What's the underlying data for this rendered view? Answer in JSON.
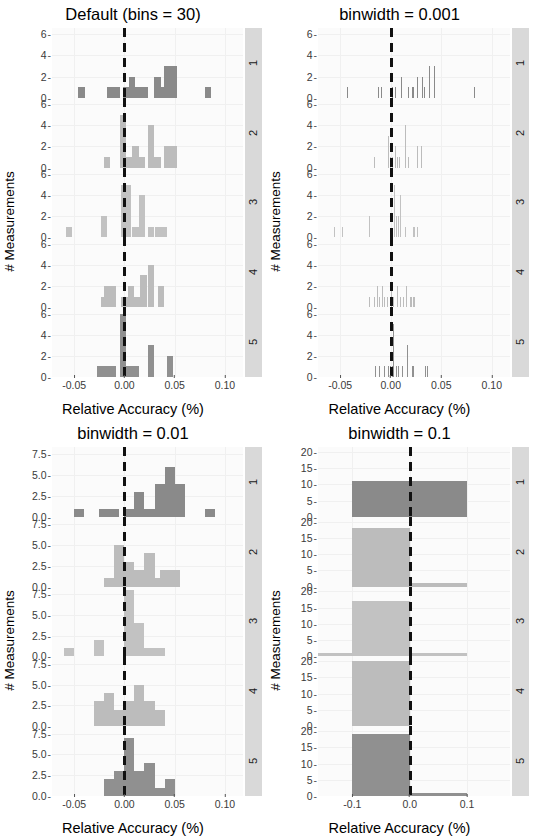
{
  "figure": {
    "xlabel": "Relative Accuracy (%)",
    "ylabel": "# Measurements",
    "strip_labels": [
      "1",
      "2",
      "3",
      "4",
      "5"
    ],
    "facet_colors": [
      "#8a8a8a",
      "#bcbcbc",
      "#c2c2c2",
      "#bcbcbc",
      "#909090"
    ],
    "refline_color": "#111111",
    "refline_value": 0
  },
  "chart_data": [
    {
      "id": "default-bins-30",
      "type": "bar",
      "title": "Default (bins = 30)",
      "xlabel": "Relative Accuracy (%)",
      "ylabel": "# Measurements",
      "xlim": [
        -0.072,
        0.118
      ],
      "ylim": [
        0,
        6.6
      ],
      "xticks": [
        -0.05,
        0.0,
        0.05,
        0.1
      ],
      "xticklabels": [
        "-0.05",
        "0.00",
        "0.05",
        "0.10"
      ],
      "yticks": [
        0,
        2,
        4,
        6
      ],
      "yticklabels": [
        "0",
        "2",
        "4",
        "6"
      ],
      "binwidth": 0.0063,
      "grid": true,
      "legend": "none",
      "facets": [
        {
          "label": "1",
          "bins": [
            {
              "x": -0.0425,
              "w": 0.0063,
              "y": 1
            },
            {
              "x": -0.011,
              "w": 0.0126,
              "y": 1
            },
            {
              "x": 0.0016,
              "w": 0.0063,
              "y": 1
            },
            {
              "x": 0.0079,
              "w": 0.0063,
              "y": 2
            },
            {
              "x": 0.0142,
              "w": 0.0063,
              "y": 1
            },
            {
              "x": 0.0205,
              "w": 0.0063,
              "y": 1
            },
            {
              "x": 0.0331,
              "w": 0.0063,
              "y": 2
            },
            {
              "x": 0.0394,
              "w": 0.0063,
              "y": 1
            },
            {
              "x": 0.0457,
              "w": 0.0126,
              "y": 3
            },
            {
              "x": 0.0835,
              "w": 0.0063,
              "y": 1
            }
          ]
        },
        {
          "label": "2",
          "bins": [
            {
              "x": -0.0173,
              "w": 0.0063,
              "y": 1
            },
            {
              "x": -0.0016,
              "w": 0.0063,
              "y": 5
            },
            {
              "x": 0.0047,
              "w": 0.0063,
              "y": 1
            },
            {
              "x": 0.011,
              "w": 0.0063,
              "y": 2
            },
            {
              "x": 0.0173,
              "w": 0.0063,
              "y": 1
            },
            {
              "x": 0.0268,
              "w": 0.0063,
              "y": 4
            },
            {
              "x": 0.0331,
              "w": 0.0063,
              "y": 1
            },
            {
              "x": 0.0457,
              "w": 0.0126,
              "y": 2
            }
          ]
        },
        {
          "label": "3",
          "bins": [
            {
              "x": -0.0551,
              "w": 0.0063,
              "y": 1
            },
            {
              "x": -0.0205,
              "w": 0.0063,
              "y": 2
            },
            {
              "x": 0.0016,
              "w": 0.0095,
              "y": 5
            },
            {
              "x": 0.0111,
              "w": 0.0063,
              "y": 1
            },
            {
              "x": 0.0174,
              "w": 0.0063,
              "y": 4
            },
            {
              "x": 0.0268,
              "w": 0.0063,
              "y": 1
            },
            {
              "x": 0.0363,
              "w": 0.0126,
              "y": 1
            }
          ]
        },
        {
          "label": "4",
          "bins": [
            {
              "x": -0.0205,
              "w": 0.0063,
              "y": 1
            },
            {
              "x": -0.0142,
              "w": 0.0126,
              "y": 2
            },
            {
              "x": 0.0,
              "w": 0.0063,
              "y": 1
            },
            {
              "x": 0.0063,
              "w": 0.0063,
              "y": 2
            },
            {
              "x": 0.0126,
              "w": 0.0063,
              "y": 1
            },
            {
              "x": 0.0189,
              "w": 0.0063,
              "y": 3
            },
            {
              "x": 0.0268,
              "w": 0.0063,
              "y": 4
            },
            {
              "x": 0.0363,
              "w": 0.0063,
              "y": 2
            }
          ]
        },
        {
          "label": "5",
          "bins": [
            {
              "x": -0.0173,
              "w": 0.0189,
              "y": 1
            },
            {
              "x": -0.0016,
              "w": 0.0063,
              "y": 6
            },
            {
              "x": 0.0047,
              "w": 0.0189,
              "y": 1
            },
            {
              "x": 0.0268,
              "w": 0.0063,
              "y": 3
            },
            {
              "x": 0.0457,
              "w": 0.0063,
              "y": 2
            }
          ]
        }
      ]
    },
    {
      "id": "binwidth-0.001",
      "type": "bar",
      "title": "binwidth = 0.001",
      "xlabel": "Relative Accuracy (%)",
      "ylabel": "# Measurements",
      "xlim": [
        -0.072,
        0.118
      ],
      "ylim": [
        0,
        6.6
      ],
      "xticks": [
        -0.05,
        0.0,
        0.05,
        0.1
      ],
      "xticklabels": [
        "-0.05",
        "0.00",
        "0.05",
        "0.10"
      ],
      "yticks": [
        0,
        2,
        4,
        6
      ],
      "yticklabels": [
        "0",
        "2",
        "4",
        "6"
      ],
      "binwidth": 0.001,
      "grid": true,
      "legend": "none",
      "facets": [
        {
          "label": "1",
          "bins": [
            {
              "x": -0.043,
              "w": 0.001,
              "y": 1
            },
            {
              "x": -0.012,
              "w": 0.001,
              "y": 1
            },
            {
              "x": -0.009,
              "w": 0.001,
              "y": 1
            },
            {
              "x": 0.002,
              "w": 0.001,
              "y": 1
            },
            {
              "x": 0.005,
              "w": 0.001,
              "y": 1
            },
            {
              "x": 0.011,
              "w": 0.001,
              "y": 2
            },
            {
              "x": 0.018,
              "w": 0.001,
              "y": 1
            },
            {
              "x": 0.022,
              "w": 0.001,
              "y": 1
            },
            {
              "x": 0.026,
              "w": 0.001,
              "y": 2
            },
            {
              "x": 0.031,
              "w": 0.001,
              "y": 2
            },
            {
              "x": 0.033,
              "w": 0.001,
              "y": 1
            },
            {
              "x": 0.038,
              "w": 0.001,
              "y": 3
            },
            {
              "x": 0.043,
              "w": 0.001,
              "y": 3
            },
            {
              "x": 0.083,
              "w": 0.001,
              "y": 1
            }
          ]
        },
        {
          "label": "2",
          "bins": [
            {
              "x": -0.016,
              "w": 0.001,
              "y": 1
            },
            {
              "x": -0.002,
              "w": 0.001,
              "y": 3
            },
            {
              "x": 0.0,
              "w": 0.001,
              "y": 1
            },
            {
              "x": 0.002,
              "w": 0.001,
              "y": 1
            },
            {
              "x": 0.0045,
              "w": 0.001,
              "y": 2
            },
            {
              "x": 0.007,
              "w": 0.001,
              "y": 1
            },
            {
              "x": 0.0085,
              "w": 0.001,
              "y": 1
            },
            {
              "x": 0.015,
              "w": 0.001,
              "y": 4
            },
            {
              "x": 0.018,
              "w": 0.001,
              "y": 1
            },
            {
              "x": 0.026,
              "w": 0.001,
              "y": 2
            },
            {
              "x": 0.03,
              "w": 0.001,
              "y": 2
            }
          ]
        },
        {
          "label": "3",
          "bins": [
            {
              "x": -0.056,
              "w": 0.001,
              "y": 1
            },
            {
              "x": -0.048,
              "w": 0.001,
              "y": 1
            },
            {
              "x": -0.021,
              "w": 0.001,
              "y": 2
            },
            {
              "x": 0.004,
              "w": 0.001,
              "y": 5
            },
            {
              "x": 0.006,
              "w": 0.001,
              "y": 2
            },
            {
              "x": 0.0075,
              "w": 0.001,
              "y": 2
            },
            {
              "x": 0.01,
              "w": 0.001,
              "y": 4
            },
            {
              "x": 0.015,
              "w": 0.001,
              "y": 1
            },
            {
              "x": 0.023,
              "w": 0.001,
              "y": 1
            },
            {
              "x": 0.026,
              "w": 0.001,
              "y": 1
            }
          ]
        },
        {
          "label": "4",
          "bins": [
            {
              "x": -0.021,
              "w": 0.001,
              "y": 1
            },
            {
              "x": -0.016,
              "w": 0.001,
              "y": 1
            },
            {
              "x": -0.013,
              "w": 0.001,
              "y": 2
            },
            {
              "x": -0.011,
              "w": 0.001,
              "y": 1
            },
            {
              "x": -0.008,
              "w": 0.001,
              "y": 2
            },
            {
              "x": -0.006,
              "w": 0.001,
              "y": 1
            },
            {
              "x": -0.003,
              "w": 0.001,
              "y": 1
            },
            {
              "x": 0.001,
              "w": 0.001,
              "y": 2
            },
            {
              "x": 0.003,
              "w": 0.001,
              "y": 1
            },
            {
              "x": 0.007,
              "w": 0.001,
              "y": 2
            },
            {
              "x": 0.01,
              "w": 0.001,
              "y": 1
            },
            {
              "x": 0.013,
              "w": 0.001,
              "y": 1
            },
            {
              "x": 0.016,
              "w": 0.001,
              "y": 2
            },
            {
              "x": 0.02,
              "w": 0.001,
              "y": 1
            },
            {
              "x": 0.023,
              "w": 0.001,
              "y": 1
            }
          ]
        },
        {
          "label": "5",
          "bins": [
            {
              "x": -0.015,
              "w": 0.001,
              "y": 1
            },
            {
              "x": -0.011,
              "w": 0.001,
              "y": 1
            },
            {
              "x": -0.006,
              "w": 0.001,
              "y": 1
            },
            {
              "x": -0.002,
              "w": 0.001,
              "y": 1
            },
            {
              "x": 0.0,
              "w": 0.001,
              "y": 1
            },
            {
              "x": 0.0015,
              "w": 0.001,
              "y": 1
            },
            {
              "x": 0.003,
              "w": 0.001,
              "y": 5
            },
            {
              "x": 0.0055,
              "w": 0.001,
              "y": 1
            },
            {
              "x": 0.008,
              "w": 0.001,
              "y": 1
            },
            {
              "x": 0.012,
              "w": 0.001,
              "y": 1
            },
            {
              "x": 0.017,
              "w": 0.001,
              "y": 3
            },
            {
              "x": 0.022,
              "w": 0.001,
              "y": 1
            },
            {
              "x": 0.034,
              "w": 0.001,
              "y": 1
            },
            {
              "x": 0.036,
              "w": 0.001,
              "y": 1
            }
          ]
        }
      ]
    },
    {
      "id": "binwidth-0.01",
      "type": "bar",
      "title": "binwidth = 0.01",
      "xlabel": "Relative Accuracy (%)",
      "ylabel": "# Measurements",
      "xlim": [
        -0.072,
        0.118
      ],
      "ylim": [
        0,
        8.4
      ],
      "xticks": [
        -0.05,
        0.0,
        0.05,
        0.1
      ],
      "xticklabels": [
        "-0.05",
        "0.00",
        "0.05",
        "0.10"
      ],
      "yticks": [
        0.0,
        2.5,
        5.0,
        7.5
      ],
      "yticklabels": [
        "0.0",
        "2.5",
        "5.0",
        "7.5"
      ],
      "binwidth": 0.01,
      "grid": true,
      "legend": "none",
      "facets": [
        {
          "label": "1",
          "bins": [
            {
              "x": -0.045,
              "w": 0.01,
              "y": 1
            },
            {
              "x": -0.015,
              "w": 0.02,
              "y": 1
            },
            {
              "x": 0.005,
              "w": 0.01,
              "y": 1
            },
            {
              "x": 0.015,
              "w": 0.01,
              "y": 3
            },
            {
              "x": 0.025,
              "w": 0.01,
              "y": 1
            },
            {
              "x": 0.035,
              "w": 0.01,
              "y": 4
            },
            {
              "x": 0.045,
              "w": 0.01,
              "y": 6
            },
            {
              "x": 0.055,
              "w": 0.01,
              "y": 4
            },
            {
              "x": 0.085,
              "w": 0.01,
              "y": 1
            }
          ]
        },
        {
          "label": "2",
          "bins": [
            {
              "x": -0.015,
              "w": 0.01,
              "y": 1
            },
            {
              "x": -0.005,
              "w": 0.01,
              "y": 5
            },
            {
              "x": 0.005,
              "w": 0.01,
              "y": 3
            },
            {
              "x": 0.015,
              "w": 0.01,
              "y": 2
            },
            {
              "x": 0.025,
              "w": 0.01,
              "y": 4
            },
            {
              "x": 0.035,
              "w": 0.01,
              "y": 1
            },
            {
              "x": 0.045,
              "w": 0.02,
              "y": 2
            }
          ]
        },
        {
          "label": "3",
          "bins": [
            {
              "x": -0.055,
              "w": 0.01,
              "y": 1
            },
            {
              "x": -0.025,
              "w": 0.01,
              "y": 2
            },
            {
              "x": 0.005,
              "w": 0.01,
              "y": 8
            },
            {
              "x": 0.015,
              "w": 0.01,
              "y": 4
            },
            {
              "x": 0.025,
              "w": 0.03,
              "y": 1
            }
          ]
        },
        {
          "label": "4",
          "bins": [
            {
              "x": -0.025,
              "w": 0.01,
              "y": 3
            },
            {
              "x": -0.015,
              "w": 0.01,
              "y": 4
            },
            {
              "x": -0.005,
              "w": 0.01,
              "y": 2
            },
            {
              "x": 0.005,
              "w": 0.01,
              "y": 3
            },
            {
              "x": 0.015,
              "w": 0.01,
              "y": 5
            },
            {
              "x": 0.025,
              "w": 0.01,
              "y": 3
            },
            {
              "x": 0.035,
              "w": 0.01,
              "y": 2
            }
          ]
        },
        {
          "label": "5",
          "bins": [
            {
              "x": -0.015,
              "w": 0.01,
              "y": 2
            },
            {
              "x": -0.005,
              "w": 0.01,
              "y": 3
            },
            {
              "x": 0.005,
              "w": 0.01,
              "y": 7
            },
            {
              "x": 0.015,
              "w": 0.01,
              "y": 3
            },
            {
              "x": 0.025,
              "w": 0.01,
              "y": 4
            },
            {
              "x": 0.035,
              "w": 0.01,
              "y": 1
            },
            {
              "x": 0.045,
              "w": 0.01,
              "y": 2
            }
          ]
        }
      ]
    },
    {
      "id": "binwidth-0.1",
      "type": "bar",
      "title": "binwidth = 0.1",
      "xlabel": "Relative Accuracy (%)",
      "ylabel": "# Measurements",
      "xlim": [
        -0.16,
        0.175
      ],
      "ylim": [
        0,
        21.5
      ],
      "xticks": [
        -0.1,
        0.0,
        0.1
      ],
      "xticklabels": [
        "-0.1",
        "0.0",
        "0.1"
      ],
      "yticks": [
        0,
        5,
        10,
        15,
        20
      ],
      "yticklabels": [
        "0",
        "5",
        "10",
        "15",
        "20"
      ],
      "binwidth": 0.1,
      "grid": true,
      "legend": "none",
      "facets": [
        {
          "label": "1",
          "bins": [
            {
              "x": -0.05,
              "w": 0.1,
              "y": 11
            },
            {
              "x": 0.05,
              "w": 0.1,
              "y": 11
            }
          ]
        },
        {
          "label": "2",
          "bins": [
            {
              "x": -0.05,
              "w": 0.1,
              "y": 18
            },
            {
              "x": 0.05,
              "w": 0.1,
              "y": 1
            }
          ]
        },
        {
          "label": "3",
          "bins": [
            {
              "x": -0.15,
              "w": 0.1,
              "y": 1
            },
            {
              "x": -0.05,
              "w": 0.1,
              "y": 17
            },
            {
              "x": 0.05,
              "w": 0.1,
              "y": 1
            }
          ]
        },
        {
          "label": "4",
          "bins": [
            {
              "x": -0.05,
              "w": 0.1,
              "y": 20
            }
          ]
        },
        {
          "label": "5",
          "bins": [
            {
              "x": -0.05,
              "w": 0.1,
              "y": 19
            },
            {
              "x": 0.05,
              "w": 0.1,
              "y": 1
            }
          ]
        }
      ]
    }
  ]
}
